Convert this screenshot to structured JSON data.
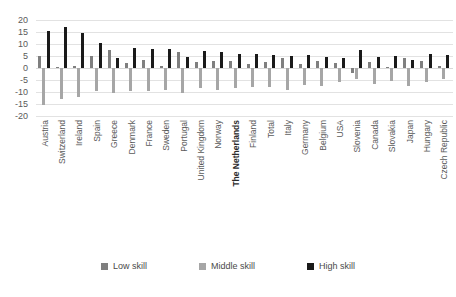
{
  "chart_data": {
    "type": "bar",
    "title": "",
    "subtitle": "",
    "xlabel": "",
    "ylabel": "",
    "ylim": [
      -20,
      20
    ],
    "ytick_step": 5,
    "yticks": [
      20,
      15,
      10,
      5,
      0,
      -5,
      -10,
      -15,
      -20
    ],
    "grid": true,
    "grid_axis": "y",
    "legend_position": "bottom",
    "orientation": "vertical",
    "highlight_category": "The Netherlands",
    "categories": [
      "Austria",
      "Switzerland",
      "Ireland",
      "Spain",
      "Greece",
      "Denmark",
      "France",
      "Sweden",
      "Portugal",
      "United Kingdom",
      "Norway",
      "The Netherlands",
      "Finland",
      "Total",
      "Italy",
      "Germany",
      "Belgium",
      "USA",
      "Slovenia",
      "Canada",
      "Slovakia",
      "Japan",
      "Hungary",
      "Czech Republic"
    ],
    "series": [
      {
        "name": "Low skill",
        "color": "#7f7f7f",
        "values": [
          5.0,
          0.5,
          1.0,
          5.0,
          7.5,
          2.0,
          3.5,
          1.0,
          6.5,
          2.5,
          3.0,
          3.0,
          1.5,
          2.5,
          4.0,
          1.5,
          3.0,
          2.0,
          -2.0,
          2.5,
          0.5,
          4.0,
          3.0,
          1.0
        ]
      },
      {
        "name": "Middle skill",
        "color": "#a6a6a6",
        "values": [
          -15.5,
          -13.0,
          -12.0,
          -9.5,
          -10.5,
          -9.5,
          -9.5,
          -9.0,
          -10.5,
          -8.5,
          -9.0,
          -8.5,
          -8.0,
          -8.0,
          -9.0,
          -7.0,
          -7.5,
          -6.0,
          -4.5,
          -6.5,
          -5.5,
          -7.5,
          -6.0,
          -4.5
        ]
      },
      {
        "name": "High skill",
        "color": "#1a1a1a",
        "values": [
          15.5,
          17.0,
          14.5,
          10.5,
          4.0,
          8.5,
          8.0,
          8.0,
          4.5,
          7.0,
          6.5,
          6.0,
          6.0,
          5.5,
          5.0,
          5.5,
          4.5,
          4.0,
          7.5,
          4.5,
          5.0,
          3.5,
          6.0,
          5.5
        ]
      }
    ]
  },
  "legend": {
    "items": [
      {
        "label": "Low skill",
        "color": "#7f7f7f"
      },
      {
        "label": "Middle skill",
        "color": "#a6a6a6"
      },
      {
        "label": "High skill",
        "color": "#1a1a1a"
      }
    ]
  }
}
